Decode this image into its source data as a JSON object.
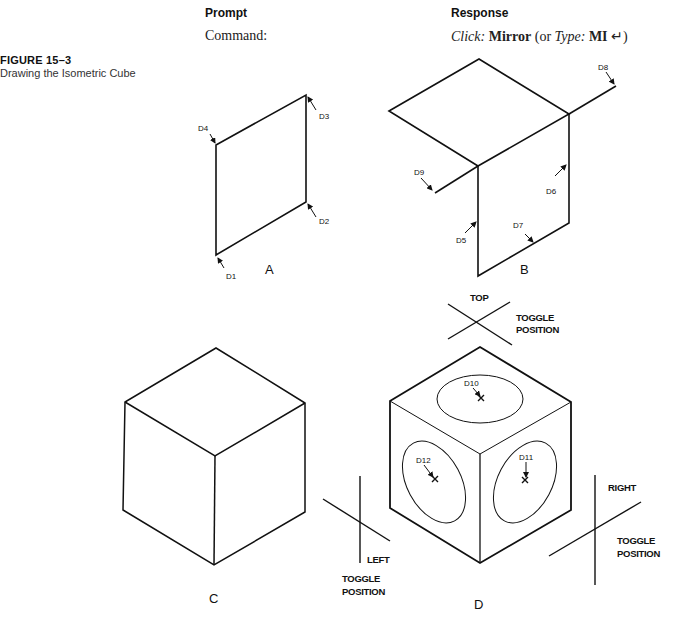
{
  "figure": {
    "number": "FIGURE 15–3",
    "caption": "Drawing the Isometric Cube"
  },
  "table": {
    "prompt_header": "Prompt",
    "response_header": "Response",
    "rows": [
      {
        "prompt": "Command:",
        "response": {
          "click_prefix": "Click:",
          "click_value": "Mirror",
          "or_text": "(or",
          "type_prefix": "Type:",
          "type_value": "MI",
          "enter_symbol": "↵",
          "close_paren": ")"
        }
      }
    ]
  },
  "diagram": {
    "panels": [
      {
        "id": "A",
        "label": "A",
        "points": [
          "D1",
          "D2",
          "D3",
          "D4"
        ]
      },
      {
        "id": "B",
        "label": "B",
        "points": [
          "D5",
          "D6",
          "D7",
          "D8",
          "D9"
        ]
      },
      {
        "id": "C",
        "label": "C"
      },
      {
        "id": "D",
        "label": "D",
        "points": [
          "D10",
          "D11",
          "D12"
        ]
      }
    ],
    "point_labels": {
      "d1": "D1",
      "d2": "D2",
      "d3": "D3",
      "d4": "D4",
      "d5": "D5",
      "d6": "D6",
      "d7": "D7",
      "d8": "D8",
      "d9": "D9",
      "d10": "D10",
      "d11": "D11",
      "d12": "D12"
    },
    "toggle": {
      "top": "TOP",
      "left": "LEFT",
      "right": "RIGHT",
      "toggle_word": "TOGGLE",
      "position_word": "POSITION"
    },
    "stroke_color": "#111111"
  }
}
